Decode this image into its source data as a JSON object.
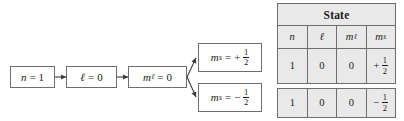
{
  "diagram": {
    "chain": [
      {
        "id": "n-box",
        "symbol": "n",
        "sub": "",
        "sign": "",
        "value": "1",
        "fraction": null
      },
      {
        "id": "l-box",
        "symbol": "ℓ",
        "sub": "",
        "sign": "",
        "value": "0",
        "fraction": null
      },
      {
        "id": "ml-box",
        "symbol": "m",
        "sub": "ℓ",
        "sign": "",
        "value": "0",
        "fraction": null
      }
    ],
    "branches": [
      {
        "id": "ms-plus-box",
        "symbol": "m",
        "sub": "s",
        "sign": "+",
        "value": "",
        "fraction": {
          "num": "1",
          "den": "2"
        }
      },
      {
        "id": "ms-minus-box",
        "symbol": "m",
        "sub": "s",
        "sign": "−",
        "value": "",
        "fraction": {
          "num": "1",
          "den": "2"
        }
      }
    ],
    "equals": "=",
    "line_color": "#3c3c3c",
    "box_border_color": "#6e6e6e",
    "box_fill": "#ffffff"
  },
  "table": {
    "title": "State",
    "fill": "#e9e9e9",
    "border_color": "#6e6e6e",
    "columns": [
      {
        "symbol": "n",
        "sub": ""
      },
      {
        "symbol": "ℓ",
        "sub": ""
      },
      {
        "symbol": "m",
        "sub": "ℓ"
      },
      {
        "symbol": "m",
        "sub": "s"
      }
    ],
    "rows": [
      {
        "id": "state-row-1",
        "cells": [
          {
            "text": "1",
            "sign": "",
            "fraction": null
          },
          {
            "text": "0",
            "sign": "",
            "fraction": null
          },
          {
            "text": "0",
            "sign": "",
            "fraction": null
          },
          {
            "text": "",
            "sign": "+",
            "fraction": {
              "num": "1",
              "den": "2"
            }
          }
        ]
      },
      {
        "id": "state-row-2",
        "cells": [
          {
            "text": "1",
            "sign": "",
            "fraction": null
          },
          {
            "text": "0",
            "sign": "",
            "fraction": null
          },
          {
            "text": "0",
            "sign": "",
            "fraction": null
          },
          {
            "text": "",
            "sign": "−",
            "fraction": {
              "num": "1",
              "den": "2"
            }
          }
        ]
      }
    ]
  }
}
